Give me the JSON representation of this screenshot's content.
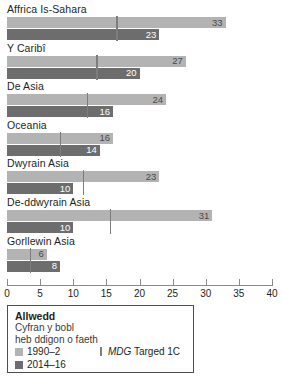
{
  "chart_data": {
    "type": "bar",
    "orientation": "horizontal",
    "title": "",
    "xlabel": "",
    "ylabel": "",
    "xlim": [
      0,
      40
    ],
    "xticks": [
      0,
      5,
      10,
      15,
      20,
      25,
      30,
      35,
      40
    ],
    "grid": false,
    "categories": [
      "Affrica Is-Sahara",
      "Y Caribî",
      "De Asia",
      "Oceania",
      "Dwyrain Asia",
      "De-ddwyrain Asia",
      "Gorllewin Asia"
    ],
    "series": [
      {
        "name": "1990–2",
        "color": "#b3b3b3",
        "values": [
          33,
          27,
          24,
          16,
          23,
          31,
          6
        ]
      },
      {
        "name": "2014–16",
        "color": "#6d6d6d",
        "values": [
          23,
          20,
          16,
          14,
          10,
          10,
          8
        ]
      }
    ],
    "target_marker": {
      "name": "MDG Targed 1C",
      "color": "#7d7d7d",
      "values": [
        16.5,
        13.5,
        12,
        8,
        11.5,
        15.5,
        3.5
      ]
    },
    "legend_position": "below-left"
  },
  "axis": {
    "ticks": [
      {
        "value": 0,
        "label": "0"
      },
      {
        "value": 5,
        "label": "5"
      },
      {
        "value": 10,
        "label": "10"
      },
      {
        "value": 15,
        "label": "15"
      },
      {
        "value": 20,
        "label": "20"
      },
      {
        "value": 25,
        "label": "25"
      },
      {
        "value": 30,
        "label": "30"
      },
      {
        "value": 35,
        "label": "35"
      },
      {
        "value": 40,
        "label": "40"
      }
    ]
  },
  "legend": {
    "title": "Allwedd",
    "subtitle_line1": "Cyfran y bobl",
    "subtitle_line2": "heb ddigon o faeth",
    "series_labels": [
      "1990–2",
      "2014–16"
    ],
    "target_label_italic": "MDG",
    "target_label_rest": " Targed 1C"
  },
  "colors": {
    "series_1990": "#b3b3b3",
    "series_2014": "#6d6d6d",
    "target_line": "#7d7d7d",
    "axis": "#8a8a8a",
    "text": "#231f20"
  }
}
